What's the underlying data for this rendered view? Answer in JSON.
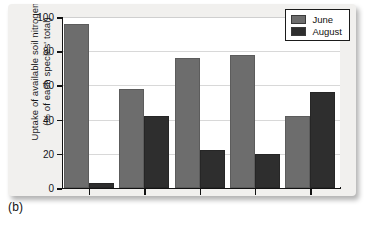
{
  "figure": {
    "panel_label": "(b)",
    "colors": {
      "june": "#6d6d6d",
      "august": "#2e2e2e",
      "card_background": "#f1f0ee",
      "plot_background": "#ffffff",
      "axis": "#121212",
      "gridline": "#d8d8d8"
    }
  },
  "chart_data": {
    "type": "bar",
    "title": "",
    "subtitle": "",
    "xlabel": "",
    "ylabel": "Uptake of available soil nitrogen (% of each species' total)",
    "ylabel_lines": [
      "Uptake of available soil nitrogen",
      "(% of each species' total)"
    ],
    "ylim": [
      0,
      100
    ],
    "yticks": [
      0,
      20,
      40,
      60,
      80,
      100
    ],
    "ytick_labels": [
      "0",
      "20",
      "40",
      "60",
      "80",
      "100"
    ],
    "grid": "horizontal",
    "categories": [
      "1",
      "2",
      "3",
      "4",
      "5"
    ],
    "xtick_labels": [
      "",
      "",
      "",
      "",
      ""
    ],
    "series": [
      {
        "name": "June",
        "color": "#6d6d6d",
        "values": [
          96,
          58,
          76,
          78,
          42
        ]
      },
      {
        "name": "August",
        "color": "#2e2e2e",
        "values": [
          3,
          42,
          22,
          20,
          56
        ]
      }
    ],
    "legend": {
      "position": "top-right",
      "entries": [
        "June",
        "August"
      ]
    },
    "annotations": []
  }
}
